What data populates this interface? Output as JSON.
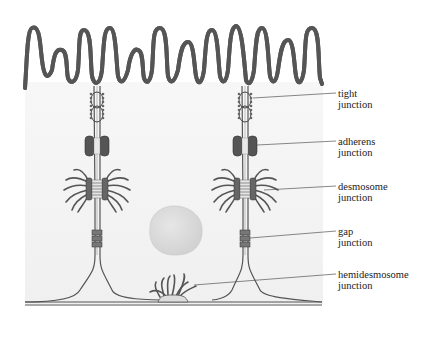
{
  "figure": {
    "type": "epithelial cell junctions diagram",
    "labels": [
      {
        "id": "tight",
        "line1": "tight",
        "line2": "junction",
        "x": 338,
        "y": 90,
        "target": [
          261,
          98
        ]
      },
      {
        "id": "adherens",
        "line1": "adherens",
        "line2": "junction",
        "x": 338,
        "y": 135,
        "target": [
          258,
          145
        ]
      },
      {
        "id": "desmosome",
        "line1": "desmosome",
        "line2": "junction",
        "x": 338,
        "y": 180,
        "target": [
          262,
          188
        ]
      },
      {
        "id": "gap",
        "line1": "gap",
        "line2": "junction",
        "x": 338,
        "y": 225,
        "target": [
          252,
          238
        ]
      },
      {
        "id": "hemidesmosome",
        "line1": "hemidesmosome",
        "line2": "junction",
        "x": 338,
        "y": 268,
        "target": [
          194,
          285
        ]
      }
    ],
    "colors": {
      "membrane": "#555555",
      "membrane_fill": "#ffffff",
      "cytoplasm": "#f3f3f3",
      "nucleus": "#dcdcdc",
      "plaque": "#444444",
      "leader_line": "#555555"
    }
  }
}
